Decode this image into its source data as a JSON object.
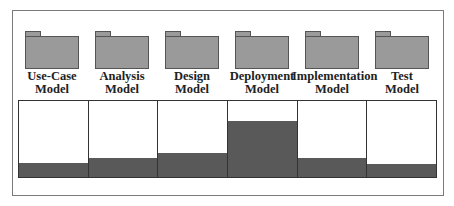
{
  "diagram": {
    "type": "model-effort-distribution",
    "models": [
      {
        "line1": "Use-Case",
        "line2": "Model",
        "fill_percent": 18
      },
      {
        "line1": "Analysis",
        "line2": "Model",
        "fill_percent": 25
      },
      {
        "line1": "Design",
        "line2": "Model",
        "fill_percent": 32
      },
      {
        "line1": "Deployment",
        "line2": "Model",
        "fill_percent": 74
      },
      {
        "line1": "Implementation",
        "line2": "Model",
        "fill_percent": 25
      },
      {
        "line1": "Test",
        "line2": "Model",
        "fill_percent": 17
      }
    ],
    "colors": {
      "folder_fill": "#9a9a9a",
      "folder_border": "#555555",
      "bar_fill": "#595959",
      "frame_border": "#7a7a7a"
    }
  }
}
